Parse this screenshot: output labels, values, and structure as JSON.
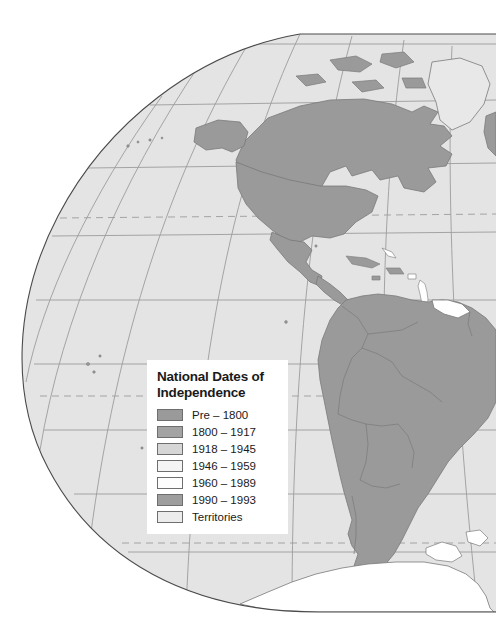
{
  "map": {
    "title": "World map centered on the Americas",
    "projection": "oblique globe / orthographic-style world map",
    "background_color": "#ffffff",
    "ocean_color": "#e4e4e4",
    "globe_outline_color": "#4a4a4a",
    "graticule_color": "#9c9c9c",
    "tropic_line_style": "dashed",
    "land_border_color": "#7a7a7a",
    "land_fills": {
      "pre_1800": "#9a9a9a",
      "y1800_1917": "#a0a0a0",
      "y1918_1945": "#d2d2d2",
      "y1946_1959": "#f2f2f2",
      "y1960_1989": "#ffffff",
      "y1990_1993": "#8f8f8f",
      "territories": "#e8e8e8"
    }
  },
  "legend": {
    "title_line1": "National Dates of",
    "title_line2": "Independence",
    "entries": [
      {
        "label": "Pre – 1800",
        "color": "#9a9a9a"
      },
      {
        "label": "1800 – 1917",
        "color": "#a3a3a3"
      },
      {
        "label": "1918 – 1945",
        "color": "#d6d6d6"
      },
      {
        "label": "1946 – 1959",
        "color": "#f4f4f4"
      },
      {
        "label": "1960 – 1989",
        "color": "#fdfdfd"
      },
      {
        "label": "1990 – 1993",
        "color": "#9e9e9e"
      },
      {
        "label": "Territories",
        "color": "#ececec"
      }
    ]
  }
}
